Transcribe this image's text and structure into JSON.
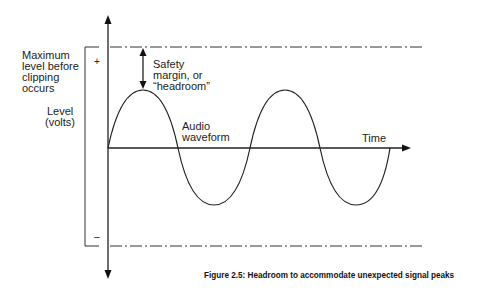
{
  "diagram": {
    "labels": {
      "max_level_line1": "Maximum",
      "max_level_line2": "level before",
      "max_level_line3": "clipping",
      "max_level_line4": "occurs",
      "level_line1": "Level",
      "level_line2": "(volts)",
      "plus_sign": "+",
      "minus_sign": "–",
      "safety_line1": "Safety",
      "safety_line2": "margin, or",
      "safety_line3": "“headroom”",
      "audio_line1": "Audio",
      "audio_line2": "waveform",
      "time": "Time"
    },
    "caption": "Figure 2.5: Headroom to accommodate unexpected signal peaks",
    "colors": {
      "line": "#1a1a1a",
      "background": "#ffffff"
    }
  }
}
